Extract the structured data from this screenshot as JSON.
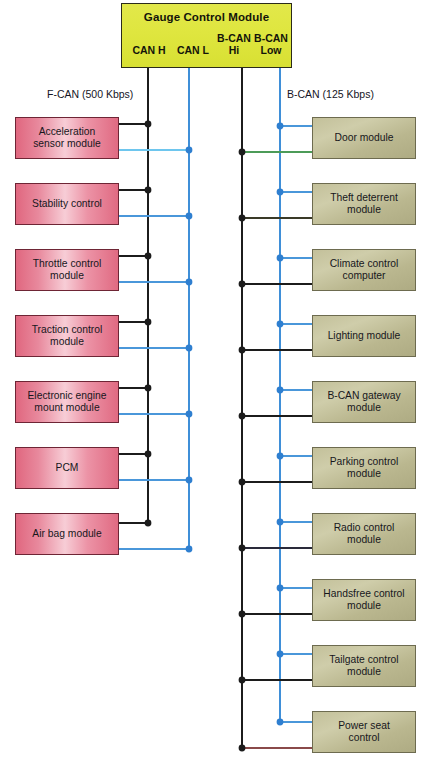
{
  "diagram": {
    "title": "Gauge Control Module",
    "background_color": "#ffffff",
    "header": {
      "label": "Gauge Control Module",
      "fill_color": "#dde43c",
      "border_color": "#2b2b1a",
      "ports": [
        {
          "name": "can-h",
          "label": "CAN H"
        },
        {
          "name": "can-l",
          "label": "CAN L"
        },
        {
          "name": "bcan-hi",
          "label": "B-CAN\nHi",
          "line1": "B-CAN",
          "line2": "Hi"
        },
        {
          "name": "bcan-low",
          "label": "B-CAN\nLow",
          "line1": "B-CAN",
          "line2": "Low"
        }
      ]
    },
    "captions": {
      "left_bus": "F-CAN (500 Kbps)",
      "right_bus": "B-CAN (125 Kbps)"
    },
    "buses": [
      {
        "name": "can-h",
        "label": "CAN H",
        "color": "#1c1c1c",
        "x": 148,
        "y_start": 68,
        "y_end": 523
      },
      {
        "name": "can-l",
        "label": "CAN L",
        "color": "#3f8fd8",
        "x": 189,
        "y_start": 68,
        "y_end": 549
      },
      {
        "name": "bcan-hi",
        "label": "B-CAN Hi",
        "color": "#1c1c1c",
        "x": 242,
        "y_start": 68,
        "y_end": 749
      },
      {
        "name": "bcan-low",
        "label": "B-CAN Low",
        "color": "#3f8fd8",
        "x": 280,
        "y_start": 68,
        "y_end": 722
      }
    ],
    "left_modules": [
      {
        "name": "acceleration-sensor-module",
        "label": "Acceleration\nsensor module",
        "line1": "Acceleration",
        "line2": "sensor module",
        "y": 117,
        "hi_y": 124,
        "lo_y": 150
      },
      {
        "name": "stability-control",
        "label": "Stability control",
        "line1": "Stability control",
        "line2": "",
        "y": 183,
        "hi_y": 190,
        "lo_y": 216
      },
      {
        "name": "throttle-control-module",
        "label": "Throttle control\nmodule",
        "line1": "Throttle control",
        "line2": "module",
        "y": 249,
        "hi_y": 256,
        "lo_y": 282
      },
      {
        "name": "traction-control-module",
        "label": "Traction control\nmodule",
        "line1": "Traction control",
        "line2": "module",
        "y": 315,
        "hi_y": 322,
        "lo_y": 348
      },
      {
        "name": "electronic-engine-mount-module",
        "label": "Electronic engine\nmount module",
        "line1": "Electronic engine",
        "line2": "mount module",
        "y": 381,
        "hi_y": 388,
        "lo_y": 414
      },
      {
        "name": "pcm",
        "label": "PCM",
        "line1": "PCM",
        "line2": "",
        "y": 447,
        "hi_y": 454,
        "lo_y": 480
      },
      {
        "name": "air-bag-module",
        "label": "Air bag module",
        "line1": "Air bag module",
        "line2": "",
        "y": 513,
        "hi_y": 523,
        "lo_y": 549
      }
    ],
    "right_modules": [
      {
        "name": "door-module",
        "label": "Door module",
        "line1": "Door module",
        "line2": "",
        "y": 117,
        "low_y": 126,
        "hi_y": 152
      },
      {
        "name": "theft-deterrent-module",
        "label": "Theft deterrent\nmodule",
        "line1": "Theft deterrent",
        "line2": "module",
        "y": 183,
        "low_y": 192,
        "hi_y": 218
      },
      {
        "name": "climate-control-computer",
        "label": "Climate control\ncomputer",
        "line1": "Climate control",
        "line2": "computer",
        "y": 249,
        "low_y": 258,
        "hi_y": 284
      },
      {
        "name": "lighting-module",
        "label": "Lighting module",
        "line1": "Lighting module",
        "line2": "",
        "y": 315,
        "low_y": 324,
        "hi_y": 350
      },
      {
        "name": "b-can-gateway-module",
        "label": "B-CAN gateway\nmodule",
        "line1": "B-CAN gateway",
        "line2": "module",
        "y": 381,
        "low_y": 390,
        "hi_y": 416
      },
      {
        "name": "parking-control-module",
        "label": "Parking control\nmodule",
        "line1": "Parking control",
        "line2": "module",
        "y": 447,
        "low_y": 456,
        "hi_y": 482
      },
      {
        "name": "radio-control-module",
        "label": "Radio control\nmodule",
        "line1": "Radio control",
        "line2": "module",
        "y": 513,
        "low_y": 522,
        "hi_y": 548
      },
      {
        "name": "handsfree-control-module",
        "label": "Handsfree control\nmodule",
        "line1": "Handsfree control",
        "line2": "module",
        "y": 579,
        "low_y": 588,
        "hi_y": 614
      },
      {
        "name": "tailgate-control-module",
        "label": "Tailgate control\nmodule",
        "line1": "Tailgate control",
        "line2": "module",
        "y": 645,
        "low_y": 654,
        "hi_y": 680
      },
      {
        "name": "power-seat-control",
        "label": "Power seat\ncontrol",
        "line1": "Power seat",
        "line2": "control",
        "y": 711,
        "low_y": 722,
        "hi_y": 748
      }
    ]
  }
}
